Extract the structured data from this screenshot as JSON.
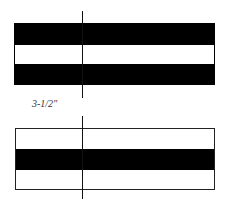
{
  "diagram": {
    "type": "stripe-layout",
    "dimension_label": "3-1/2\"",
    "colors": {
      "stripe_dark": "#000000",
      "stripe_light": "#ffffff",
      "outline": "#222222",
      "centerline": "#111111"
    },
    "top_panel": {
      "stripes": [
        "dark",
        "light",
        "dark"
      ]
    },
    "bottom_panel": {
      "stripes": [
        "light",
        "dark",
        "light"
      ]
    }
  }
}
